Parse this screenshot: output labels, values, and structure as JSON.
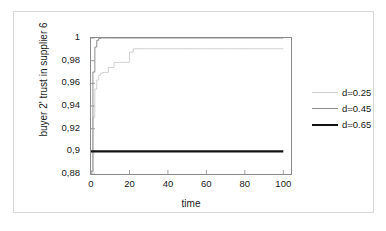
{
  "chart_data": {
    "type": "line",
    "title": "",
    "xlabel": "time",
    "ylabel": "buyer 2' trust in supplier 6",
    "xlim": [
      0,
      104
    ],
    "ylim": [
      0.88,
      1
    ],
    "xticks": [
      "0",
      "20",
      "40",
      "60",
      "80",
      "100"
    ],
    "xtick_values": [
      0,
      20,
      40,
      60,
      80,
      100
    ],
    "yticks": [
      "0,88",
      "0,9",
      "0,92",
      "0,94",
      "0,96",
      "0,98",
      "1"
    ],
    "ytick_values": [
      0.88,
      0.9,
      0.92,
      0.94,
      0.96,
      0.98,
      1
    ],
    "grid": false,
    "legend_position": "right",
    "series": [
      {
        "name": "d=0.25",
        "color": "#d0d0d0",
        "width": 1,
        "x": [
          0,
          1,
          2,
          3,
          4,
          5,
          6,
          7,
          8,
          9,
          10,
          11,
          12,
          14,
          16,
          18,
          20,
          22,
          24,
          30,
          40,
          50,
          60,
          70,
          80,
          90,
          100
        ],
        "y": [
          0.882,
          0.93,
          0.955,
          0.963,
          0.967,
          0.969,
          0.9695,
          0.9695,
          0.9695,
          0.974,
          0.974,
          0.974,
          0.9785,
          0.9785,
          0.9785,
          0.9785,
          0.9875,
          0.9905,
          0.9905,
          0.9905,
          0.9905,
          0.9905,
          0.9905,
          0.9905,
          0.9905,
          0.9905,
          0.9905
        ]
      },
      {
        "name": "d=0.45",
        "color": "#8f8f8f",
        "width": 1,
        "x": [
          0,
          1,
          2,
          3,
          4,
          5,
          6,
          8,
          10,
          20,
          40,
          60,
          80,
          100
        ],
        "y": [
          0.882,
          0.97,
          0.992,
          0.998,
          0.9995,
          1.0,
          1.0,
          1.0,
          1.0,
          1.0,
          1.0,
          1.0,
          1.0,
          1.0
        ]
      },
      {
        "name": "d=0.65",
        "color": "#111111",
        "width": 2.2,
        "x": [
          0,
          20,
          40,
          60,
          80,
          100
        ],
        "y": [
          0.9,
          0.9,
          0.9,
          0.9,
          0.9,
          0.9
        ]
      }
    ]
  },
  "legend": {
    "entries": [
      {
        "label": "d=0.25"
      },
      {
        "label": "d=0.45"
      },
      {
        "label": "d=0.65"
      }
    ]
  }
}
